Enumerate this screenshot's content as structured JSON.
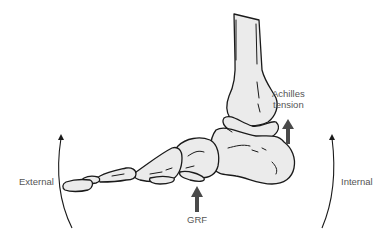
{
  "diagram": {
    "labels": {
      "achilles": [
        "Achilles",
        "tension"
      ],
      "grf": "GRF",
      "external": "External",
      "internal": "Internal"
    },
    "arrows": [
      {
        "id": "achilles-tension-arrow",
        "direction": "up"
      },
      {
        "id": "grf-arrow",
        "direction": "up"
      },
      {
        "id": "external-rotation-arrow",
        "direction": "curved-up"
      },
      {
        "id": "internal-rotation-arrow",
        "direction": "curved-up"
      }
    ],
    "colors": {
      "bone_fill": "#ebebeb",
      "outline": "#1a1a1a",
      "force_arrow": "#4a4a4a",
      "text": "#555555",
      "background": "#ffffff"
    }
  }
}
